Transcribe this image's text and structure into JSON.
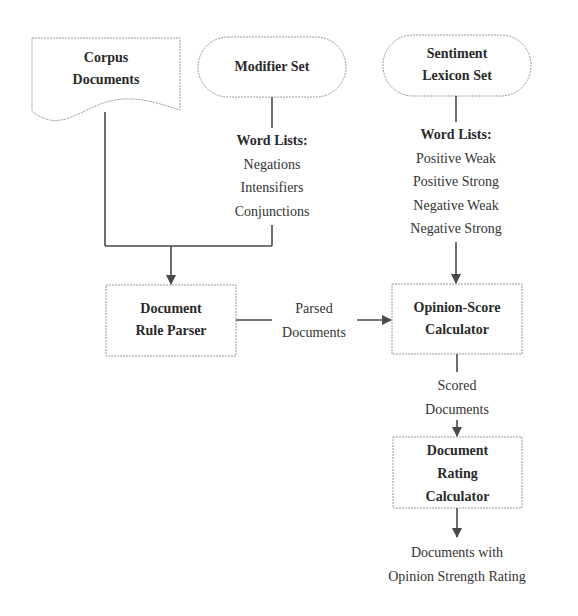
{
  "diagram": {
    "nodes": {
      "corpus": {
        "line1": "Corpus",
        "line2": "Documents",
        "shape": "document"
      },
      "modifier": {
        "line1": "Modifier Set",
        "shape": "terminator"
      },
      "lexicon": {
        "line1": "Sentiment",
        "line2": "Lexicon Set",
        "shape": "terminator"
      },
      "parser": {
        "line1": "Document",
        "line2": "Rule Parser",
        "shape": "process"
      },
      "opinion": {
        "line1": "Opinion-Score",
        "line2": "Calculator",
        "shape": "process"
      },
      "rating": {
        "line1": "Document",
        "line2": "Rating",
        "line3": "Calculator",
        "shape": "process"
      }
    },
    "modifier_lists": {
      "header": "Word Lists:",
      "items": [
        "Negations",
        "Intensifiers",
        "Conjunctions"
      ]
    },
    "lexicon_lists": {
      "header": "Word Lists:",
      "items": [
        "Positive Weak",
        "Positive Strong",
        "Negative Weak",
        "Negative Strong"
      ]
    },
    "edges": {
      "parsed": {
        "line1": "Parsed",
        "line2": "Documents"
      },
      "scored": {
        "line1": "Scored",
        "line2": "Documents"
      },
      "output": {
        "line1": "Documents with",
        "line2": "Opinion Strength Rating"
      }
    },
    "colors": {
      "background": "#ffffff",
      "border": "#9a9a9a",
      "arrow": "#4a4a4a",
      "text": "#2a2a2a"
    }
  }
}
